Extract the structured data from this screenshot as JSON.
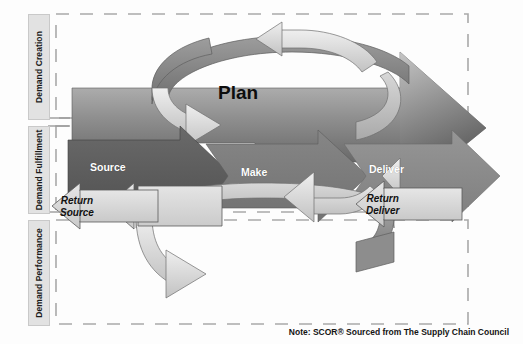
{
  "diagram": {
    "sidebar": {
      "items": [
        {
          "id": "demand-creation",
          "label": "Demand Creation"
        },
        {
          "id": "demand-fulfillment",
          "label": "Demand Fulfillment"
        },
        {
          "id": "demand-performance",
          "label": "Demand Performance"
        }
      ]
    },
    "processes": {
      "plan": "Plan",
      "source": "Source",
      "make": "Make",
      "deliver": "Deliver"
    },
    "returns": {
      "source_line1": "Return",
      "source_line2": "Source",
      "deliver_line1": "Return",
      "deliver_line2": "Deliver"
    },
    "note": "Note: SCOR® Sourced from The Supply Chain Council",
    "colors": {
      "plan_arrow_light": "#c9c9c9",
      "plan_arrow_dark": "#4d4d4d",
      "source_arrow": "#5c5c5c",
      "make_arrow": "#7d7d7d",
      "deliver_arrow": "#8c8c8c",
      "return_arrow": "#d6d6d6",
      "circle_arrow": "#d2d2d2",
      "sidebar_fill": "#e2e2e2",
      "dashed_border": "#aaaaaa",
      "background": "#fdfdfd",
      "label_text": "#1b1b1b",
      "arrow_text": "#ffffff"
    }
  }
}
